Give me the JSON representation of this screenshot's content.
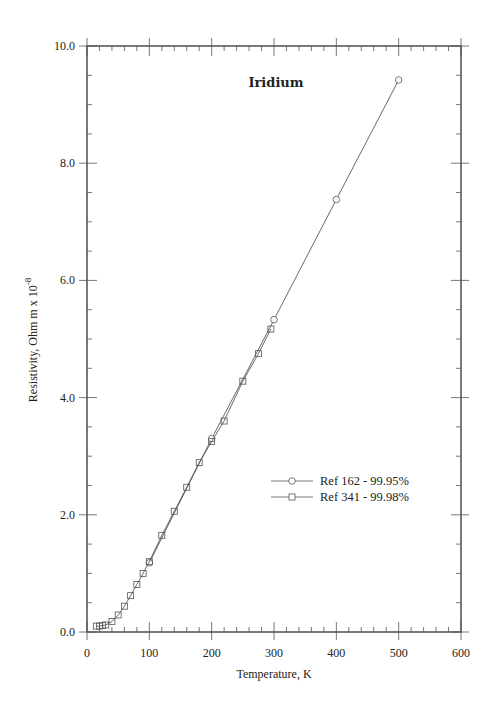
{
  "chart_data": {
    "type": "line",
    "title": "Iridium",
    "xlabel": "Temperature,  K",
    "ylabel": "Resistivity, Ohm m x 10",
    "ylabel_superscript": "-8",
    "xlim": [
      0,
      600
    ],
    "ylim": [
      0,
      10
    ],
    "x_ticks": [
      "0",
      "100",
      "200",
      "300",
      "400",
      "500",
      "600"
    ],
    "y_ticks": [
      "0.0",
      "2.0",
      "4.0",
      "6.0",
      "8.0",
      "10.0"
    ],
    "grid": false,
    "legend_position": "center-right",
    "series": [
      {
        "name": "Ref 162 - 99.95%",
        "marker": "circle",
        "x": [
          100,
          200,
          300,
          400,
          500
        ],
        "y": [
          1.18,
          3.3,
          5.33,
          7.38,
          9.42
        ]
      },
      {
        "name": "Ref 341 - 99.98%",
        "marker": "square",
        "x": [
          15,
          20,
          25,
          30,
          40,
          50,
          60,
          70,
          80,
          90,
          100,
          120,
          140,
          160,
          180,
          200,
          220,
          250,
          275,
          295
        ],
        "y": [
          0.1,
          0.1,
          0.11,
          0.12,
          0.18,
          0.29,
          0.44,
          0.62,
          0.81,
          1.0,
          1.2,
          1.65,
          2.06,
          2.47,
          2.89,
          3.25,
          3.6,
          4.28,
          4.75,
          5.17
        ]
      }
    ]
  }
}
